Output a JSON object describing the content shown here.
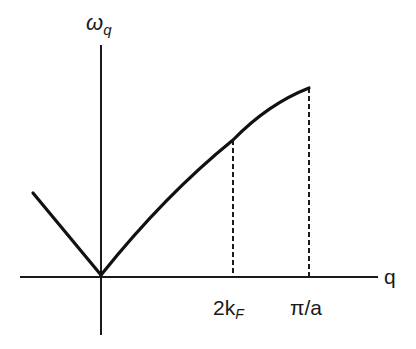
{
  "diagram": {
    "y_axis_label": {
      "main": "ω",
      "subscript": "q"
    },
    "x_axis_label": "q",
    "ticks": [
      {
        "id": "two-kf",
        "main": "2k",
        "subscript": "F"
      },
      {
        "id": "pi-over-a",
        "main": "π/a"
      }
    ],
    "curve_description": "Linear dispersion from origin, kink at 2k_F, saturating near π/a",
    "colors": {
      "line": "#111111",
      "background": "#ffffff"
    }
  }
}
